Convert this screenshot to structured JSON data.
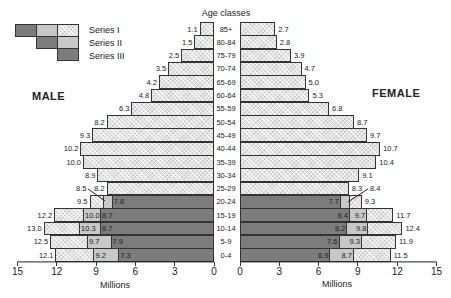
{
  "chart_data": {
    "type": "bar",
    "subtype": "population-pyramid-stacked",
    "title": "Age classes",
    "xlabel": "Millions",
    "xlim": [
      0,
      15
    ],
    "xticks": [
      0,
      3,
      6,
      9,
      12,
      15
    ],
    "legend": [
      "Series I",
      "Series II",
      "Series III"
    ],
    "legend_position": "top-left",
    "sides": {
      "left": "MALE",
      "right": "FEMALE"
    },
    "categories": [
      "85+",
      "80-84",
      "75-79",
      "70-74",
      "65-69",
      "60-64",
      "55-59",
      "50-54",
      "45-49",
      "40-44",
      "35-39",
      "30-34",
      "25-29",
      "20-24",
      "15-19",
      "10-14",
      "5-9",
      "0-4"
    ],
    "male": {
      "series_I": [
        1.1,
        1.5,
        2.5,
        3.5,
        4.2,
        4.8,
        6.3,
        8.2,
        9.3,
        10.2,
        10.0,
        8.9,
        8.2,
        9.5,
        12.2,
        13.0,
        12.5,
        12.1
      ],
      "series_II": [
        null,
        null,
        null,
        null,
        null,
        null,
        null,
        null,
        null,
        null,
        null,
        null,
        null,
        8.5,
        10.0,
        10.3,
        9.7,
        9.2
      ],
      "series_III": [
        null,
        null,
        null,
        null,
        null,
        null,
        null,
        null,
        null,
        null,
        null,
        null,
        null,
        7.8,
        8.7,
        8.7,
        7.9,
        7.3
      ]
    },
    "female": {
      "series_I": [
        2.7,
        2.8,
        3.9,
        4.7,
        5.0,
        5.3,
        6.8,
        8.7,
        9.7,
        10.7,
        10.4,
        9.1,
        8.3,
        9.3,
        11.7,
        12.4,
        11.9,
        11.5
      ],
      "series_II": [
        null,
        null,
        null,
        null,
        null,
        null,
        null,
        null,
        null,
        null,
        null,
        null,
        null,
        8.4,
        9.7,
        9.8,
        9.3,
        8.7
      ],
      "series_III": [
        null,
        null,
        null,
        null,
        null,
        null,
        null,
        null,
        null,
        null,
        null,
        null,
        null,
        7.7,
        8.4,
        8.2,
        7.6,
        6.9
      ]
    }
  },
  "labels": {
    "title": "Age classes",
    "male": "MALE",
    "female": "FEMALE",
    "xlabel": "Millions",
    "legend": [
      "Series I",
      "Series II",
      "Series III"
    ]
  },
  "colors": {
    "series_I": "crosshatch-light",
    "series_II": "#c8c8c8",
    "series_III": "#7c7c7c"
  }
}
